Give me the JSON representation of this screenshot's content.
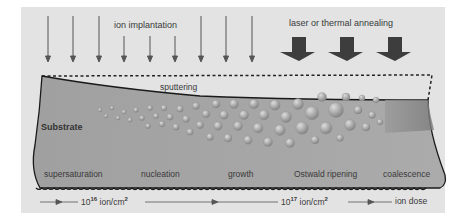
{
  "title_labels": {
    "ion_implantation": "ion implantation",
    "annealing": "laser or thermal annealing",
    "sputtering": "sputtering",
    "substrate": "Substrate"
  },
  "stages": [
    {
      "label": "supersaturation"
    },
    {
      "label": "nucleation"
    },
    {
      "label": "growth"
    },
    {
      "label": "Ostwald ripening"
    },
    {
      "label": "coalescence"
    }
  ],
  "dose_axis": {
    "dose1_base": "10",
    "dose1_exp": "16",
    "dose1_unit": " ion/cm",
    "dose1_unit_exp": "2",
    "dose2_base": "10",
    "dose2_exp": "17",
    "dose2_unit": " ion/cm",
    "dose2_unit_exp": "2",
    "end_label": "ion dose"
  },
  "colors": {
    "background": "#e3e3e3",
    "substrate": "#a9a9a9",
    "arrow_thin": "#555555",
    "arrow_block": "#3a3a3a",
    "outline": "#1a1a1a"
  }
}
